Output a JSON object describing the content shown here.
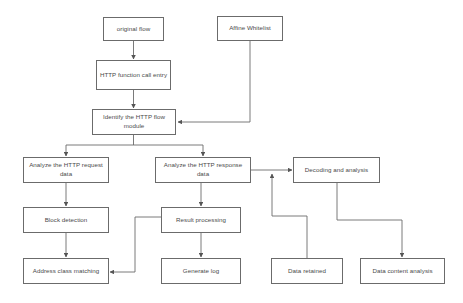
{
  "diagram": {
    "stroke_color": "#6b6b6b",
    "text_color": "#4a4a4a",
    "background_color": "#ffffff",
    "nodes": [
      {
        "id": "original-flow",
        "label": "original flow",
        "x": 103,
        "y": 17,
        "w": 61,
        "h": 24
      },
      {
        "id": "affine-whitelist",
        "label": "Affine Whitelist",
        "x": 217,
        "y": 16,
        "w": 66,
        "h": 25
      },
      {
        "id": "http-function-call",
        "label": "HTTP function call entry",
        "x": 96,
        "y": 60,
        "w": 75,
        "h": 30
      },
      {
        "id": "identify-http-flow",
        "label": "Identify the HTTP flow module",
        "x": 92,
        "y": 109,
        "w": 84,
        "h": 26
      },
      {
        "id": "analyze-request",
        "label": "Analyze the HTTP request data",
        "x": 23,
        "y": 157,
        "w": 86,
        "h": 26
      },
      {
        "id": "analyze-response",
        "label": "Analyze the HTTP response data",
        "x": 155,
        "y": 157,
        "w": 96,
        "h": 26
      },
      {
        "id": "decoding-analysis",
        "label": "Decoding and analysis",
        "x": 293,
        "y": 157,
        "w": 87,
        "h": 26
      },
      {
        "id": "block-detection",
        "label": "Block detection",
        "x": 23,
        "y": 207,
        "w": 86,
        "h": 26
      },
      {
        "id": "result-processing",
        "label": "Result processing",
        "x": 161,
        "y": 207,
        "w": 80,
        "h": 26
      },
      {
        "id": "address-class-match",
        "label": "Address class matching",
        "x": 23,
        "y": 258,
        "w": 86,
        "h": 26
      },
      {
        "id": "generate-log",
        "label": "Generate log",
        "x": 161,
        "y": 258,
        "w": 80,
        "h": 26
      },
      {
        "id": "data-retained",
        "label": "Data retained",
        "x": 271,
        "y": 258,
        "w": 72,
        "h": 26
      },
      {
        "id": "data-content-analysis",
        "label": "Data content analysis",
        "x": 360,
        "y": 258,
        "w": 85,
        "h": 26
      }
    ],
    "connectors": [
      {
        "id": "original-flow-to-http-function-call",
        "from": "original-flow",
        "to": "http-function-call"
      },
      {
        "id": "http-function-call-to-identify",
        "from": "http-function-call",
        "to": "identify-http-flow"
      },
      {
        "id": "affine-whitelist-to-identify",
        "from": "affine-whitelist",
        "to": "identify-http-flow"
      },
      {
        "id": "identify-to-analyze-request",
        "from": "identify-http-flow",
        "to": "analyze-request"
      },
      {
        "id": "identify-to-analyze-response",
        "from": "identify-http-flow",
        "to": "analyze-response"
      },
      {
        "id": "analyze-response-to-decoding",
        "from": "analyze-response",
        "to": "decoding-analysis"
      },
      {
        "id": "analyze-request-to-block-detection",
        "from": "analyze-request",
        "to": "block-detection"
      },
      {
        "id": "analyze-response-to-result",
        "from": "analyze-response",
        "to": "result-processing"
      },
      {
        "id": "block-detection-to-address-match",
        "from": "block-detection",
        "to": "address-class-match"
      },
      {
        "id": "result-to-generate-log",
        "from": "result-processing",
        "to": "generate-log"
      },
      {
        "id": "result-to-address-match",
        "from": "result-processing",
        "to": "address-class-match"
      },
      {
        "id": "data-retained-to-decoding-path",
        "from": "data-retained",
        "to": "decoding-analysis"
      },
      {
        "id": "decoding-to-data-content-analysis",
        "from": "decoding-analysis",
        "to": "data-content-analysis"
      }
    ]
  }
}
